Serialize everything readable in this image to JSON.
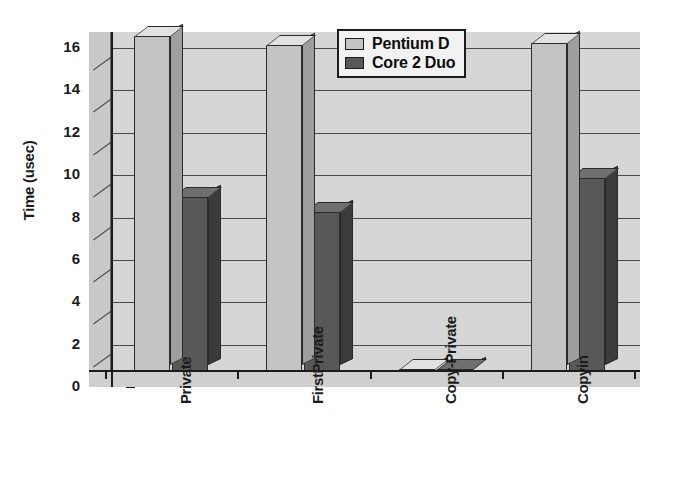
{
  "chart_data": {
    "type": "bar",
    "title": "",
    "subtitle": "",
    "xlabel": "",
    "ylabel": "Time (usec)",
    "categories": [
      "Private",
      "FirstPrivate",
      "Copy-Private",
      "Copyin"
    ],
    "series": [
      {
        "name": "Pentium D",
        "color": "#c4c4c4",
        "values": [
          15.8,
          15.4,
          0.1,
          15.5
        ]
      },
      {
        "name": "Core 2 Duo",
        "color": "#585858",
        "values": [
          8.2,
          7.5,
          0.1,
          9.1
        ]
      }
    ],
    "ylim": [
      0,
      16
    ],
    "ytick_labels": [
      "16",
      "14",
      "12",
      "10",
      "8",
      "6",
      "4",
      "2",
      "0"
    ],
    "ytick_values": [
      16,
      14,
      12,
      10,
      8,
      6,
      4,
      2,
      0
    ],
    "ytick_step": 2,
    "grid": true,
    "grid_axis": "y",
    "legend_position": "top-right",
    "style": "3d-bar-grayscale",
    "xlabel_rotation": -90
  },
  "legend": {
    "entries": [
      {
        "label": "Pentium D",
        "swatch_color": "#c4c4c4"
      },
      {
        "label": "Core 2 Duo",
        "swatch_color": "#585858"
      }
    ]
  },
  "colors": {
    "plot_background": "#d6d6d6",
    "left_wall": "#c9c9c9",
    "floor": "#cfcfcf",
    "axis": "#1b1b1b",
    "gridline": "#4a4a4a",
    "series_1": "#c4c4c4",
    "series_1_side": "#9e9e9e",
    "series_1_top": "#dedede",
    "series_2": "#585858",
    "series_2_side": "#3b3b3b",
    "series_2_top": "#6f6f6f",
    "page_background": "#ffffff"
  }
}
